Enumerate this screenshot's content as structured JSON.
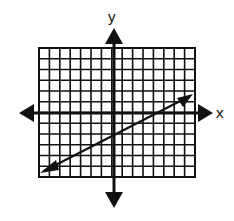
{
  "graph": {
    "x_axis_label": "x",
    "y_axis_label": "y",
    "grid": {
      "x_min": -7,
      "x_max": 8,
      "y_min": -6,
      "y_max": 6,
      "cell_px": 10.4
    },
    "line": {
      "equation": "y = x/2 - 2",
      "slope": 0.5,
      "y_intercept": -2,
      "from": [
        -7,
        -5.5
      ],
      "to": [
        7,
        1.5
      ],
      "both_arrows": true
    },
    "colors": {
      "ink": "#111111",
      "background": "#ffffff"
    }
  },
  "chart_data": {
    "type": "line",
    "title": "",
    "xlabel": "x",
    "ylabel": "y",
    "xlim": [
      -7,
      8
    ],
    "ylim": [
      -6,
      6
    ],
    "grid": true,
    "series": [
      {
        "name": "line",
        "x": [
          -7,
          7
        ],
        "y": [
          -5.5,
          1.5
        ]
      }
    ]
  }
}
